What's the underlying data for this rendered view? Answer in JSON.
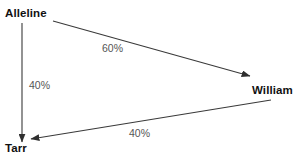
{
  "diagram": {
    "type": "directed-graph",
    "background_color": "#ffffff",
    "edge_color": "#3a3a3a",
    "node_text_color": "#111111",
    "edge_label_color": "#555555",
    "nodes": [
      {
        "id": "alleline",
        "label": "Alleline",
        "x": 22,
        "y": 20
      },
      {
        "id": "william",
        "label": "William",
        "x": 268,
        "y": 92
      },
      {
        "id": "tarr",
        "label": "Tarr",
        "x": 22,
        "y": 148
      }
    ],
    "edges": [
      {
        "id": "alleline-william",
        "from": "alleline",
        "to": "william",
        "label": "60%",
        "value": 60,
        "x1": 53,
        "y1": 21,
        "x2": 250,
        "y2": 76
      },
      {
        "id": "alleline-tarr",
        "from": "alleline",
        "to": "tarr",
        "label": "40%",
        "value": 40,
        "x1": 22,
        "y1": 23,
        "x2": 22,
        "y2": 142
      },
      {
        "id": "william-tarr",
        "from": "william",
        "to": "tarr",
        "label": "40%",
        "value": 40,
        "x1": 271,
        "y1": 100,
        "x2": 31,
        "y2": 139
      }
    ]
  },
  "chart_data": {
    "type": "diagram",
    "title": "",
    "nodes": [
      "Alleline",
      "William",
      "Tarr"
    ],
    "links": [
      {
        "source": "Alleline",
        "target": "William",
        "label": "60%",
        "value": 60
      },
      {
        "source": "Alleline",
        "target": "Tarr",
        "label": "40%",
        "value": 40
      },
      {
        "source": "William",
        "target": "Tarr",
        "label": "40%",
        "value": 40
      }
    ]
  }
}
